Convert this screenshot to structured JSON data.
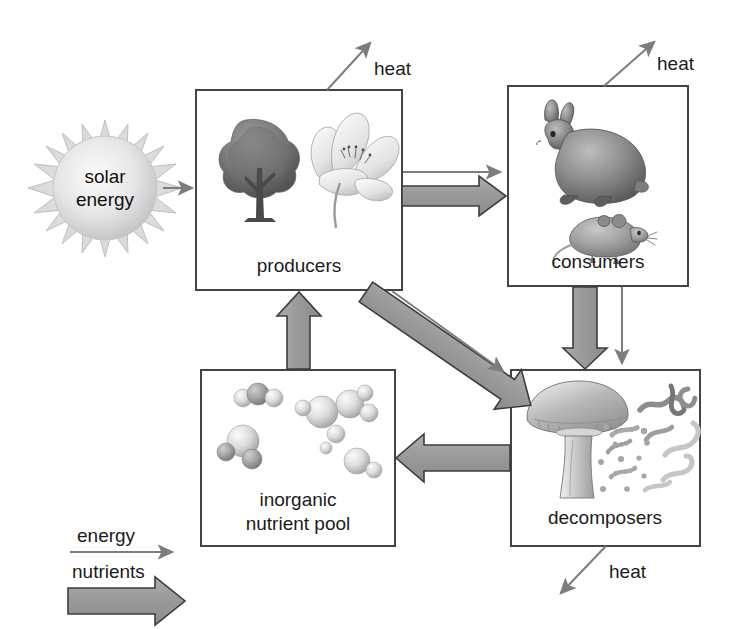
{
  "diagram": {
    "background_color": "#ffffff",
    "line_color": "#444444",
    "nutrient_arrow_fill": "#9a9a9a",
    "nutrient_arrow_stroke": "#3d3d3d",
    "energy_arrow_color": "#7d7d7d",
    "text_color": "#1b1b1b"
  },
  "sun": {
    "label_line1": "solar",
    "label_line2": "energy",
    "icon": "sun-icon"
  },
  "boxes": {
    "producers": {
      "label": "producers",
      "icons": [
        "tree-icon",
        "flower-icon"
      ]
    },
    "consumers": {
      "label": "consumers",
      "icons": [
        "rabbit-icon",
        "mouse-icon"
      ]
    },
    "decomposers": {
      "label": "decomposers",
      "icons": [
        "mushroom-icon",
        "worm-icon",
        "bacteria-icon"
      ]
    },
    "nutrient_pool": {
      "label_line1": "inorganic",
      "label_line2": "nutrient pool",
      "icons": [
        "molecule-icon"
      ]
    }
  },
  "heat_labels": {
    "producers_heat": "heat",
    "consumers_heat": "heat",
    "decomposers_heat": "heat"
  },
  "legend": {
    "energy_label": "energy",
    "nutrients_label": "nutrients"
  },
  "flows": [
    {
      "from": "solar energy",
      "to": "producers",
      "type": "energy"
    },
    {
      "from": "producers",
      "to": "consumers",
      "type": "energy"
    },
    {
      "from": "producers",
      "to": "consumers",
      "type": "nutrients"
    },
    {
      "from": "producers",
      "to": "decomposers",
      "type": "energy"
    },
    {
      "from": "producers",
      "to": "decomposers",
      "type": "nutrients"
    },
    {
      "from": "consumers",
      "to": "decomposers",
      "type": "energy"
    },
    {
      "from": "consumers",
      "to": "decomposers",
      "type": "nutrients"
    },
    {
      "from": "decomposers",
      "to": "inorganic nutrient pool",
      "type": "nutrients"
    },
    {
      "from": "inorganic nutrient pool",
      "to": "producers",
      "type": "nutrients"
    },
    {
      "from": "producers",
      "to": "heat",
      "type": "energy"
    },
    {
      "from": "consumers",
      "to": "heat",
      "type": "energy"
    },
    {
      "from": "decomposers",
      "to": "heat",
      "type": "energy"
    }
  ]
}
